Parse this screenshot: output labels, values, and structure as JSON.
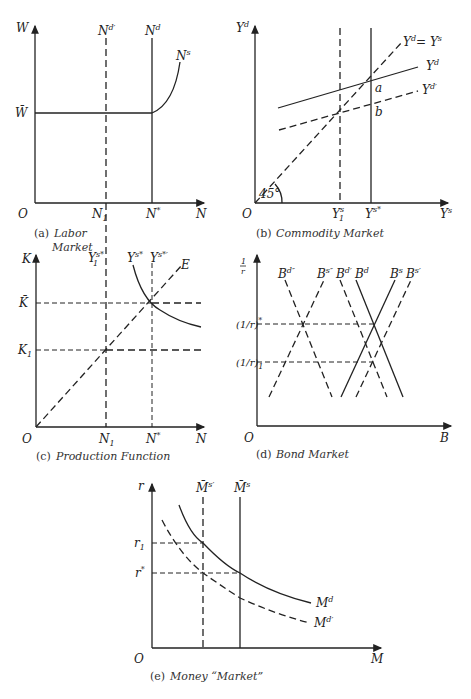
{
  "panels": {
    "a": {
      "caption_prefix": "(a)",
      "caption_line1": "Labor",
      "caption_line2": "Market",
      "y_axis": "W",
      "x_axis": "N",
      "origin": "O",
      "wbar": "W̄",
      "n1": "N",
      "n1_sub": "1",
      "nstar": "N",
      "nstar_sup": "*",
      "nd_prime": "N",
      "nd_prime_sup": "d′",
      "nd": "N",
      "nd_sup": "d",
      "ns": "N",
      "ns_sup": "s"
    },
    "b": {
      "caption_prefix": "(b)",
      "caption": "Commodity Market",
      "y_axis": "Y",
      "y_axis_sup": "d",
      "x_axis": "Y",
      "x_axis_sup": "s",
      "origin": "O",
      "angle": "45°",
      "y1s": "Y",
      "y1s_sup": "s",
      "y1s_sub": "1",
      "ysstar": "Y",
      "ysstar_sup": "s*",
      "line45": "Y",
      "line45_rest": "= Y",
      "line45_sup1": "d",
      "line45_sup2": "s",
      "yd": "Y",
      "yd_sup": "d",
      "yd_prime": "Y",
      "yd_prime_sup": "d′",
      "point_a": "a",
      "point_b": "b"
    },
    "c": {
      "caption_prefix": "(c)",
      "caption": "Production Function",
      "y_axis": "K",
      "x_axis": "N",
      "origin": "O",
      "kbar": "K̄",
      "k1": "K",
      "k1_sub": "1",
      "n1": "N",
      "n1_sub": "1",
      "nstar": "N",
      "nstar_sup": "*",
      "y1sstar": "Y",
      "y1sstar_sup": "s*",
      "y1sstar_sub": "1",
      "ysstar": "Y",
      "ysstar_sup": "s*",
      "ysstar_prime": "Y",
      "ysstar_prime_sup": "s*′",
      "e": "E"
    },
    "d": {
      "caption_prefix": "(d)",
      "caption": "Bond Market",
      "y_axis_num": "1",
      "y_axis_den": "r",
      "x_axis": "B",
      "origin": "O",
      "rstar": "(1/r)",
      "rstar_sup": "*",
      "r1": "(1/r)",
      "r1_sub": "1",
      "curves": [
        {
          "label": "B",
          "sup": "d″"
        },
        {
          "label": "B",
          "sup": "s″"
        },
        {
          "label": "B",
          "sup": "d′"
        },
        {
          "label": "B",
          "sup": "d"
        },
        {
          "label": "B",
          "sup": "s"
        },
        {
          "label": "B",
          "sup": "s′"
        }
      ]
    },
    "e": {
      "caption_prefix": "(e)",
      "caption": "Money “Market”",
      "y_axis": "r",
      "x_axis": "M",
      "origin": "O",
      "r1": "r",
      "r1_sub": "1",
      "rstar": "r",
      "rstar_sup": "*",
      "ms_prime": "M̄",
      "ms_prime_sup": "s′",
      "ms": "M̄",
      "ms_sup": "s",
      "md": "M",
      "md_sup": "d",
      "md_prime": "M",
      "md_prime_sup": "d′"
    }
  }
}
